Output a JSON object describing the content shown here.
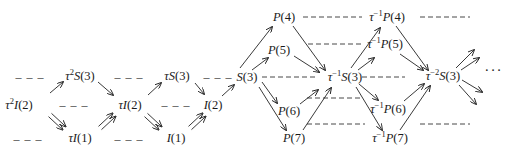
{
  "diagram": {
    "nodes": [
      {
        "id": "t2S3",
        "label": "τ²S(3)",
        "x": 80,
        "y": 76
      },
      {
        "id": "tS3",
        "label": "τS(3)",
        "x": 177,
        "y": 76
      },
      {
        "id": "S3",
        "label": "S(3)",
        "x": 247,
        "y": 77
      },
      {
        "id": "t2I2",
        "label": "τ²I(2)",
        "x": 19,
        "y": 105
      },
      {
        "id": "tI2",
        "label": "τI(2)",
        "x": 130,
        "y": 105
      },
      {
        "id": "I2",
        "label": "I(2)",
        "x": 213,
        "y": 105
      },
      {
        "id": "tI1",
        "label": "τI(1)",
        "x": 80,
        "y": 138
      },
      {
        "id": "I1",
        "label": "I(1)",
        "x": 176,
        "y": 138
      },
      {
        "id": "P4",
        "label": "P(4)",
        "x": 284,
        "y": 17
      },
      {
        "id": "P5",
        "label": "P(5)",
        "x": 279,
        "y": 50
      },
      {
        "id": "P6",
        "label": "P(6)",
        "x": 289,
        "y": 111
      },
      {
        "id": "P7",
        "label": "P(7)",
        "x": 294,
        "y": 138
      },
      {
        "id": "ti1S3",
        "label": "τ⁻¹S(3)",
        "x": 345,
        "y": 77
      },
      {
        "id": "ti1P4",
        "label": "τ⁻¹P(4)",
        "x": 387,
        "y": 17
      },
      {
        "id": "ti1P5",
        "label": "τ⁻¹P(5)",
        "x": 385,
        "y": 44
      },
      {
        "id": "ti1P6",
        "label": "τ⁻¹P(6)",
        "x": 388,
        "y": 109
      },
      {
        "id": "ti1P7",
        "label": "τ⁻¹P(7)",
        "x": 390,
        "y": 138
      },
      {
        "id": "ti2S3",
        "label": "τ⁻²S(3)",
        "x": 443,
        "y": 76
      }
    ],
    "dashes": [
      {
        "x": 30,
        "y": 77,
        "w": 28
      },
      {
        "x": 129,
        "y": 77,
        "w": 28
      },
      {
        "x": 218,
        "y": 77,
        "w": 24
      },
      {
        "x": 74,
        "y": 105,
        "w": 28
      },
      {
        "x": 176,
        "y": 105,
        "w": 28
      },
      {
        "x": 28,
        "y": 139,
        "w": 28
      },
      {
        "x": 129,
        "y": 139,
        "w": 28
      }
    ],
    "dashed_lines": [
      {
        "x1": 303,
        "y1": 17,
        "x2": 362,
        "y2": 17
      },
      {
        "x1": 420,
        "y1": 17,
        "x2": 470,
        "y2": 17
      },
      {
        "x1": 308,
        "y1": 44,
        "x2": 363,
        "y2": 44
      },
      {
        "x1": 262,
        "y1": 77,
        "x2": 315,
        "y2": 77
      },
      {
        "x1": 362,
        "y1": 77,
        "x2": 405,
        "y2": 77
      },
      {
        "x1": 307,
        "y1": 98,
        "x2": 360,
        "y2": 98
      },
      {
        "x1": 307,
        "y1": 124,
        "x2": 365,
        "y2": 124
      },
      {
        "x1": 420,
        "y1": 124,
        "x2": 470,
        "y2": 124
      }
    ],
    "arrows": [
      {
        "x1": 50,
        "y1": 93,
        "x2": 63,
        "y2": 82
      },
      {
        "x1": 98,
        "y1": 82,
        "x2": 113,
        "y2": 95
      },
      {
        "x1": 148,
        "y1": 95,
        "x2": 161,
        "y2": 83
      },
      {
        "x1": 195,
        "y1": 83,
        "x2": 204,
        "y2": 94
      },
      {
        "x1": 222,
        "y1": 96,
        "x2": 234,
        "y2": 85
      },
      {
        "x1": 240,
        "y1": 68,
        "x2": 272,
        "y2": 27
      },
      {
        "x1": 252,
        "y1": 70,
        "x2": 268,
        "y2": 58
      },
      {
        "x1": 262,
        "y1": 82,
        "x2": 277,
        "y2": 103
      },
      {
        "x1": 259,
        "y1": 87,
        "x2": 286,
        "y2": 130
      },
      {
        "x1": 293,
        "y1": 26,
        "x2": 325,
        "y2": 70
      },
      {
        "x1": 294,
        "y1": 56,
        "x2": 319,
        "y2": 72
      },
      {
        "x1": 300,
        "y1": 104,
        "x2": 318,
        "y2": 90
      },
      {
        "x1": 303,
        "y1": 130,
        "x2": 331,
        "y2": 88
      },
      {
        "x1": 351,
        "y1": 68,
        "x2": 380,
        "y2": 28
      },
      {
        "x1": 358,
        "y1": 70,
        "x2": 374,
        "y2": 58
      },
      {
        "x1": 359,
        "y1": 84,
        "x2": 378,
        "y2": 100
      },
      {
        "x1": 356,
        "y1": 87,
        "x2": 382,
        "y2": 130
      },
      {
        "x1": 396,
        "y1": 26,
        "x2": 428,
        "y2": 70
      },
      {
        "x1": 400,
        "y1": 54,
        "x2": 423,
        "y2": 70
      },
      {
        "x1": 404,
        "y1": 101,
        "x2": 424,
        "y2": 84
      },
      {
        "x1": 400,
        "y1": 130,
        "x2": 430,
        "y2": 86
      },
      {
        "x1": 456,
        "y1": 68,
        "x2": 474,
        "y2": 50
      },
      {
        "x1": 461,
        "y1": 70,
        "x2": 479,
        "y2": 58
      },
      {
        "x1": 462,
        "y1": 80,
        "x2": 482,
        "y2": 92
      },
      {
        "x1": 459,
        "y1": 85,
        "x2": 476,
        "y2": 104
      }
    ],
    "double_arrows": [
      {
        "x1": 50,
        "y1": 115,
        "x2": 64,
        "y2": 128
      },
      {
        "x1": 100,
        "y1": 128,
        "x2": 114,
        "y2": 115
      },
      {
        "x1": 146,
        "y1": 115,
        "x2": 160,
        "y2": 128
      },
      {
        "x1": 190,
        "y1": 128,
        "x2": 204,
        "y2": 115
      }
    ],
    "ellipsis": {
      "label": "···",
      "x": 494,
      "y": 70
    }
  }
}
